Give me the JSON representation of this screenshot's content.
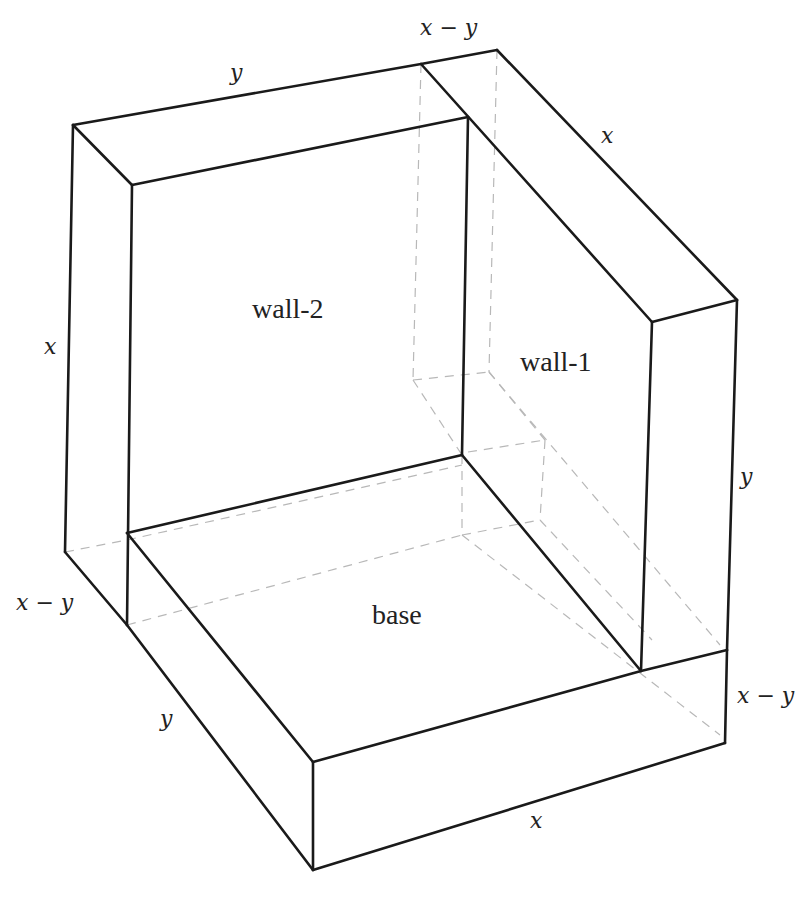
{
  "diagram": {
    "type": "3D box decomposition (isometric sketch)",
    "faces": {
      "wall_2": "wall-2",
      "wall_1": "wall-1",
      "base": "base"
    },
    "dimension_labels": {
      "top_back_y": "y",
      "top_back_x_minus_y": "x − y",
      "top_right_x": "x",
      "left_x": "x",
      "right_y": "y",
      "left_x_minus_y": "x − y",
      "front_left_y": "y",
      "right_x_minus_y": "x − y",
      "front_bottom_x": "x"
    },
    "colors": {
      "edge": "#1a1a1a",
      "hidden_edge": "#b8b8b8",
      "background": "#ffffff"
    }
  }
}
